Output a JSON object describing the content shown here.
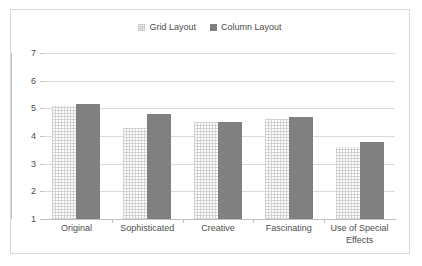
{
  "chart_data": {
    "type": "bar",
    "title": "",
    "subtitle": "",
    "xlabel": "",
    "ylabel": "",
    "ylim": [
      1,
      7
    ],
    "yticks": [
      1,
      2,
      3,
      4,
      5,
      6,
      7
    ],
    "ytick_labels": [
      "1",
      "2",
      "3",
      "4",
      "5",
      "6",
      "7"
    ],
    "grid": true,
    "legend_position": "top-center",
    "categories": [
      "Original",
      "Sophisticated",
      "Creative",
      "Fascinating",
      "Use of Special Effects"
    ],
    "category_lines": [
      [
        "Original"
      ],
      [
        "Sophisticated"
      ],
      [
        "Creative"
      ],
      [
        "Fascinating"
      ],
      [
        "Use of Special",
        "Effects"
      ]
    ],
    "series": [
      {
        "name": "Grid Layout",
        "color": "#fcfcfc",
        "values": [
          5.1,
          4.3,
          4.5,
          4.6,
          3.6
        ]
      },
      {
        "name": "Column Layout",
        "color": "#808080",
        "values": [
          5.15,
          4.8,
          4.5,
          4.67,
          3.8
        ]
      }
    ]
  }
}
